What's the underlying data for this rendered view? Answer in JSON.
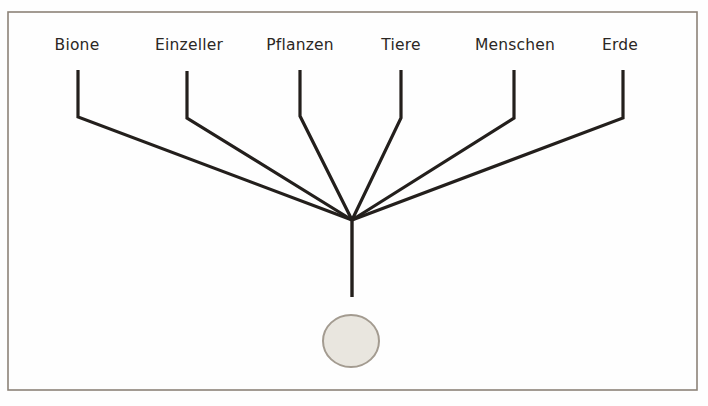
{
  "figure": {
    "background_color": "#fefefe",
    "frame": {
      "name": "figure-frame",
      "color": "#8d8378",
      "x": 8,
      "y": 12,
      "width": 689,
      "height": 378
    },
    "line_color": "#231f1c",
    "labels": [
      {
        "id": "bione",
        "text": "Bione",
        "x": 77,
        "y": 36
      },
      {
        "id": "einzeller",
        "text": "Einzeller",
        "x": 189,
        "y": 36
      },
      {
        "id": "pflanzen",
        "text": "Pflanzen",
        "x": 300,
        "y": 36
      },
      {
        "id": "tiere",
        "text": "Tiere",
        "x": 401,
        "y": 36
      },
      {
        "id": "menschen",
        "text": "Menschen",
        "x": 515,
        "y": 36
      },
      {
        "id": "erde",
        "text": "Erde",
        "x": 620,
        "y": 36
      }
    ],
    "branches": [
      {
        "id": "bione",
        "stub_x": 78,
        "stub_top": 70,
        "elbow_y": 117
      },
      {
        "id": "einzeller",
        "stub_x": 187,
        "stub_top": 71,
        "elbow_y": 118
      },
      {
        "id": "pflanzen",
        "stub_x": 300,
        "stub_top": 70,
        "elbow_y": 116
      },
      {
        "id": "tiere",
        "stub_x": 401,
        "stub_top": 70,
        "elbow_y": 118
      },
      {
        "id": "menschen",
        "stub_x": 514,
        "stub_top": 70,
        "elbow_y": 118
      },
      {
        "id": "erde",
        "stub_x": 623,
        "stub_top": 70,
        "elbow_y": 118
      }
    ],
    "junction": {
      "name": "branch-junction",
      "x": 352,
      "y": 220
    },
    "trunk": {
      "name": "trunk-line",
      "x": 352,
      "top": 220,
      "bottom": 297
    },
    "egg": {
      "name": "egg-shape",
      "cx": 351,
      "cy": 341,
      "rx": 28,
      "ry": 26,
      "fill": "#e9e6df",
      "stroke": "#a39b90"
    }
  },
  "chart_data": {
    "type": "diagram",
    "title": "Bione",
    "categories": [
      "Bione",
      "Einzeller",
      "Pflanzen",
      "Tiere",
      "Menschen",
      "Erde"
    ],
    "branch_count": 6,
    "junction": {
      "x": 352,
      "y": 220
    },
    "nodes": [
      {
        "label": "Bione",
        "tip_x": 78,
        "tip_y": 70,
        "elbow_x": 78,
        "elbow_y": 117
      },
      {
        "label": "Einzeller",
        "tip_x": 187,
        "tip_y": 71,
        "elbow_x": 187,
        "elbow_y": 118
      },
      {
        "label": "Pflanzen",
        "tip_x": 300,
        "tip_y": 70,
        "elbow_x": 300,
        "elbow_y": 116
      },
      {
        "label": "Tiere",
        "tip_x": 401,
        "tip_y": 70,
        "elbow_x": 401,
        "elbow_y": 118
      },
      {
        "label": "Menschen",
        "tip_x": 514,
        "tip_y": 70,
        "elbow_x": 514,
        "elbow_y": 118
      },
      {
        "label": "Erde",
        "tip_x": 623,
        "tip_y": 70,
        "elbow_x": 623,
        "elbow_y": 118
      }
    ],
    "trunk": {
      "from": [
        352,
        220
      ],
      "to": [
        352,
        297
      ]
    },
    "egg": {
      "center": [
        351,
        341
      ],
      "rx": 28,
      "ry": 26
    }
  }
}
